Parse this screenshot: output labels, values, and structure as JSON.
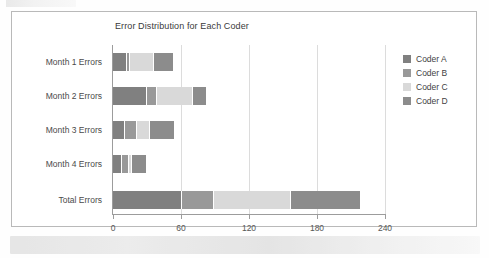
{
  "chart_data": {
    "type": "bar",
    "orientation": "horizontal",
    "stacked": true,
    "title": "Error Distribution for Each Coder",
    "xlabel": "",
    "ylabel": "",
    "xlim": [
      0,
      240
    ],
    "grid": true,
    "legend_position": "right",
    "xticks": [
      "0",
      "60",
      "120",
      "180",
      "240"
    ],
    "xtick_values": [
      0,
      60,
      120,
      180,
      240
    ],
    "categories": [
      "Month 1 Errors",
      "Month 2 Errors",
      "Month 3 Errors",
      "Month 4 Errors",
      "Total Errors"
    ],
    "series": [
      {
        "name": "Coder A",
        "color": "#808080",
        "values": [
          12,
          30,
          11,
          8,
          61
        ]
      },
      {
        "name": "Coder B",
        "color": "#999999",
        "values": [
          3,
          9,
          10,
          6,
          28
        ]
      },
      {
        "name": "Coder C",
        "color": "#d9d9d9",
        "values": [
          21,
          32,
          12,
          3,
          68
        ]
      },
      {
        "name": "Coder D",
        "color": "#8c8c8c",
        "values": [
          17,
          11,
          21,
          12,
          61
        ]
      }
    ],
    "totals": [
      53,
      82,
      54,
      29,
      218
    ]
  },
  "legend": {
    "items": [
      {
        "label": "Coder A",
        "color": "#808080"
      },
      {
        "label": "Coder B",
        "color": "#999999"
      },
      {
        "label": "Coder C",
        "color": "#d9d9d9"
      },
      {
        "label": "Coder D",
        "color": "#8c8c8c"
      }
    ]
  }
}
